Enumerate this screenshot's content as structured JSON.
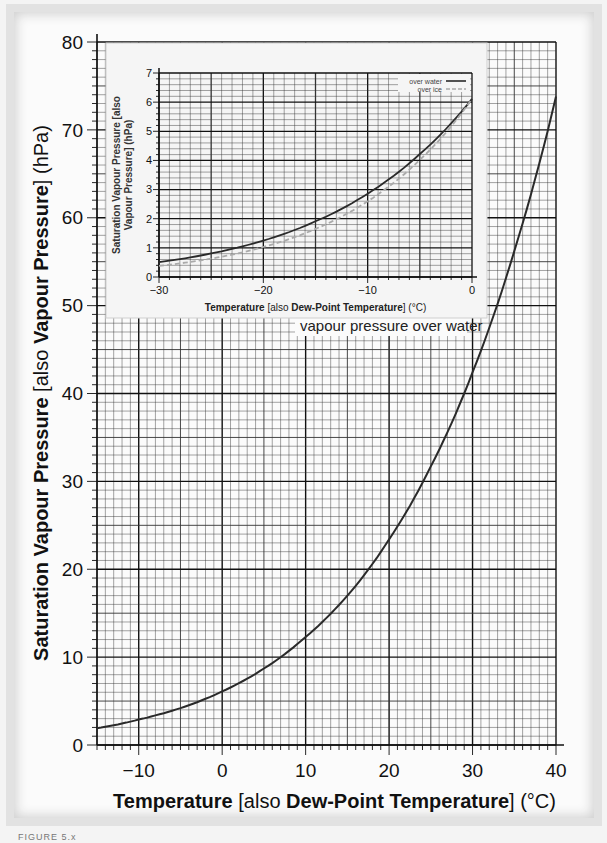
{
  "chart_data": [
    {
      "type": "line",
      "name": "main",
      "title": "",
      "xlabel_parts": [
        {
          "text": "Temperature",
          "bold": true
        },
        {
          "text": " [also ",
          "bold": false
        },
        {
          "text": "Dew-Point Temperature",
          "bold": true
        },
        {
          "text": "] (°C)",
          "bold": false
        }
      ],
      "ylabel_parts": [
        {
          "text": "Saturation Vapour Pressure",
          "bold": true
        },
        {
          "text": " [also ",
          "bold": false
        },
        {
          "text": "Vapour Pressure",
          "bold": true
        },
        {
          "text": "] (hPa)",
          "bold": false
        }
      ],
      "xlim": [
        -15,
        40
      ],
      "ylim": [
        0,
        80
      ],
      "xticks": [
        -10,
        0,
        10,
        20,
        30,
        40
      ],
      "xtick_labels": [
        "−10",
        "0",
        "10",
        "20",
        "30",
        "40"
      ],
      "yticks": [
        0,
        10,
        20,
        30,
        40,
        50,
        60,
        70,
        80
      ],
      "grid": true,
      "annotation": "vapour pressure over water",
      "series": [
        {
          "name": "vapour pressure over water",
          "style": "solid",
          "color": "#2a2a2a",
          "x": [
            -15,
            -10,
            -5,
            0,
            5,
            10,
            15,
            20,
            25,
            30,
            35,
            40
          ],
          "y": [
            1.9,
            2.9,
            4.2,
            6.1,
            8.7,
            12.3,
            17.0,
            23.4,
            31.7,
            42.4,
            56.2,
            73.8
          ]
        }
      ]
    },
    {
      "type": "line",
      "name": "inset",
      "xlabel_parts": [
        {
          "text": "Temperature",
          "bold": true
        },
        {
          "text": " [also ",
          "bold": false
        },
        {
          "text": "Dew-Point Temperature",
          "bold": true
        },
        {
          "text": "] (°C)",
          "bold": false
        }
      ],
      "ylabel_line1": "Saturation Vapour Pressure [also",
      "ylabel_line2": "Vapour Pressure] (hPa)",
      "xlim": [
        -30,
        0
      ],
      "ylim": [
        0,
        7
      ],
      "xticks": [
        -30,
        -20,
        -10,
        0
      ],
      "xtick_labels": [
        "−30",
        "−20",
        "−10",
        "0"
      ],
      "yticks": [
        0,
        1,
        2,
        3,
        4,
        5,
        6,
        7
      ],
      "grid": true,
      "legend": {
        "position": "upper right",
        "entries": [
          "over water",
          "over ice"
        ]
      },
      "series": [
        {
          "name": "over water",
          "style": "solid",
          "color": "#2a2a2a",
          "x": [
            -30,
            -25,
            -20,
            -15,
            -10,
            -5,
            0
          ],
          "y": [
            0.51,
            0.81,
            1.25,
            1.91,
            2.86,
            4.22,
            6.11
          ]
        },
        {
          "name": "over ice",
          "style": "dashed",
          "color": "#aaaaaa",
          "x": [
            -30,
            -25,
            -20,
            -15,
            -10,
            -5,
            0
          ],
          "y": [
            0.38,
            0.63,
            1.03,
            1.65,
            2.6,
            4.02,
            6.11
          ]
        }
      ]
    }
  ],
  "caption": "FIGURE 5.x"
}
